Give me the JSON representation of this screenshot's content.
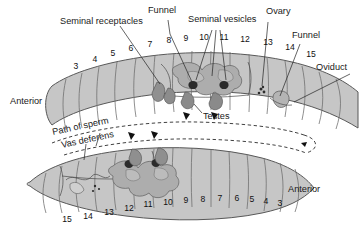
{
  "figure": {
    "background_color": "#ffffff"
  },
  "colors": {
    "body_fill": "#c6c6c6",
    "body_fill_light": "#d2d2d2",
    "body_outline": "#585858",
    "segment_line": "#6b6b6b",
    "organ_mid": "#a9a9a9",
    "organ_dark": "#8a8a8a",
    "funnel_dark": "#2b2b2b",
    "leader": "#222222",
    "text": "#1a1a1a"
  },
  "labels": {
    "seminal_receptacles": "Seminal receptacles",
    "funnel_top": "Funnel",
    "seminal_vesicles": "Seminal vesicles",
    "ovary": "Ovary",
    "funnel_right": "Funnel",
    "oviduct": "Oviduct",
    "testes": "Testes",
    "path_of_sperm": "Path of sperm",
    "vas_deferens": "Vas deferens",
    "anterior_left": "Anterior",
    "anterior_right": "Anterior"
  },
  "top_worm": {
    "name": "upper-earthworm",
    "orientation": "anterior-left",
    "segment_numbers": [
      "3",
      "4",
      "5",
      "6",
      "7",
      "8",
      "9",
      "10",
      "11",
      "12",
      "13",
      "14",
      "15"
    ]
  },
  "bottom_worm": {
    "name": "lower-earthworm",
    "orientation": "anterior-right",
    "segment_numbers": [
      "15",
      "14",
      "13",
      "12",
      "11",
      "10",
      "9",
      "8",
      "7",
      "6",
      "5",
      "4",
      "3"
    ]
  },
  "segment_positions": {
    "top": [
      {
        "n": "3",
        "x": 76,
        "y": 69
      },
      {
        "n": "4",
        "x": 95,
        "y": 62
      },
      {
        "n": "5",
        "x": 113,
        "y": 56
      },
      {
        "n": "6",
        "x": 131,
        "y": 51
      },
      {
        "n": "7",
        "x": 150,
        "y": 47
      },
      {
        "n": "8",
        "x": 169,
        "y": 43
      },
      {
        "n": "9",
        "x": 186,
        "y": 41
      },
      {
        "n": "10",
        "x": 204,
        "y": 40
      },
      {
        "n": "11",
        "x": 224,
        "y": 40
      },
      {
        "n": "12",
        "x": 245,
        "y": 42
      },
      {
        "n": "13",
        "x": 268,
        "y": 45
      },
      {
        "n": "14",
        "x": 290,
        "y": 50
      },
      {
        "n": "15",
        "x": 311,
        "y": 57
      }
    ],
    "bottom": [
      {
        "n": "15",
        "x": 67,
        "y": 222
      },
      {
        "n": "14",
        "x": 88,
        "y": 219
      },
      {
        "n": "13",
        "x": 109,
        "y": 215
      },
      {
        "n": "12",
        "x": 129,
        "y": 211
      },
      {
        "n": "11",
        "x": 148,
        "y": 207
      },
      {
        "n": "10",
        "x": 168,
        "y": 205
      },
      {
        "n": "9",
        "x": 186,
        "y": 203
      },
      {
        "n": "8",
        "x": 203,
        "y": 202
      },
      {
        "n": "7",
        "x": 220,
        "y": 201
      },
      {
        "n": "6",
        "x": 237,
        "y": 201
      },
      {
        "n": "5",
        "x": 252,
        "y": 202
      },
      {
        "n": "4",
        "x": 266,
        "y": 204
      },
      {
        "n": "3",
        "x": 280,
        "y": 206
      }
    ]
  },
  "organs": {
    "seminal_receptacles_count": 2,
    "seminal_vesicles_count": 3,
    "testes_count": 2,
    "funnels_count": 2,
    "ovary_count": 1,
    "oviduct_count": 1
  }
}
